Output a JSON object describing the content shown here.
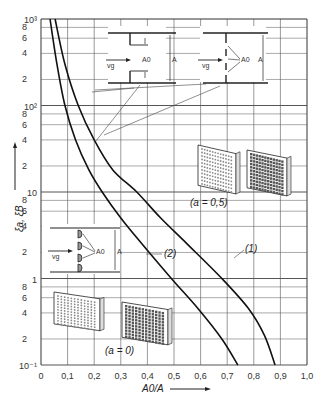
{
  "chart_data": {
    "type": "line",
    "title": "",
    "xlabel": "A0/A",
    "ylabel": "ξa, ξB",
    "xlim": [
      0,
      1.0
    ],
    "ylim": [
      0.1,
      1000
    ],
    "yscale": "log",
    "grid": true,
    "x_ticks": [
      "0",
      "0,1",
      "0,2",
      "0,3",
      "0,4",
      "0,5",
      "0,6",
      "0,7",
      "0,8",
      "0,9",
      "1,0"
    ],
    "y_decade_labels": [
      "10⁻¹",
      "1",
      "10",
      "10²",
      "10³"
    ],
    "y_minor_labels": [
      "2",
      "4",
      "6",
      "8"
    ],
    "series": [
      {
        "name": "(1)",
        "x": [
          0.053,
          0.09,
          0.14,
          0.2,
          0.27,
          0.36,
          0.45,
          0.55,
          0.68,
          0.78,
          0.84,
          0.88
        ],
        "y": [
          1000,
          300,
          100,
          40,
          18,
          10,
          5,
          2.5,
          1,
          0.45,
          0.22,
          0.1
        ]
      },
      {
        "name": "(2)",
        "x": [
          0.034,
          0.06,
          0.09,
          0.13,
          0.18,
          0.23,
          0.3,
          0.38,
          0.49,
          0.59,
          0.68,
          0.74
        ],
        "y": [
          1000,
          300,
          100,
          40,
          18,
          10,
          5,
          2.5,
          1,
          0.45,
          0.2,
          0.1
        ]
      }
    ],
    "annotations": [
      {
        "text": "(1)",
        "target": "curve-1"
      },
      {
        "text": "(2)",
        "target": "curve-2"
      },
      {
        "text": "(a = 0,5)",
        "target": "perforated plates"
      },
      {
        "text": "(a = 0)",
        "target": "thin plates"
      }
    ],
    "insets": {
      "orifice": {
        "vg": "vg",
        "a0": "A0",
        "a": "A"
      },
      "grid_sharp": {
        "vg": "vg",
        "a0": "A0",
        "a": "A"
      },
      "grid_rounded": {
        "vg": "vg",
        "a0": "A0",
        "a": "A"
      }
    }
  }
}
